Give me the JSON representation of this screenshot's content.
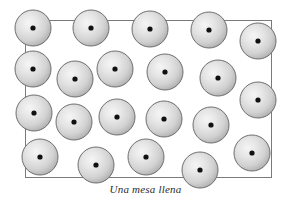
{
  "figure": {
    "caption": "Una mesa llena",
    "width": 291,
    "height": 201,
    "background_color": "#ffffff"
  },
  "table_rect": {
    "name": "table-outline",
    "x": 25,
    "y": 20,
    "width": 247,
    "height": 158,
    "stroke_color": "#7a7a7a",
    "stroke_width": 1,
    "fill_color": "none"
  },
  "sphere_style": {
    "radius": 18,
    "fill_light": "#f2f2f2",
    "fill_mid": "#d9d9d9",
    "fill_dark": "#a8a8a8",
    "stroke_color": "#6f6f6f",
    "stroke_width": 1,
    "center_dot_radius": 2.6,
    "center_dot_color": "#111111",
    "highlight_offset_x": "38%",
    "highlight_offset_y": "36%"
  },
  "spheres": [
    {
      "id": "sphere-1",
      "row": 1,
      "cx": 33,
      "cy": 28
    },
    {
      "id": "sphere-2",
      "row": 1,
      "cx": 91,
      "cy": 28
    },
    {
      "id": "sphere-3",
      "row": 1,
      "cx": 150,
      "cy": 29
    },
    {
      "id": "sphere-4",
      "row": 1,
      "cx": 209,
      "cy": 30
    },
    {
      "id": "sphere-5",
      "row": 1,
      "cx": 258,
      "cy": 41
    },
    {
      "id": "sphere-6",
      "row": 2,
      "cx": 33,
      "cy": 69
    },
    {
      "id": "sphere-7",
      "row": 2,
      "cx": 75,
      "cy": 79
    },
    {
      "id": "sphere-8",
      "row": 2,
      "cx": 115,
      "cy": 69
    },
    {
      "id": "sphere-9",
      "row": 2,
      "cx": 165,
      "cy": 72
    },
    {
      "id": "sphere-10",
      "row": 2,
      "cx": 218,
      "cy": 78
    },
    {
      "id": "sphere-11",
      "row": 3,
      "cx": 258,
      "cy": 100
    },
    {
      "id": "sphere-12",
      "row": 3,
      "cx": 34,
      "cy": 113
    },
    {
      "id": "sphere-13",
      "row": 3,
      "cx": 74,
      "cy": 122
    },
    {
      "id": "sphere-14",
      "row": 3,
      "cx": 117,
      "cy": 117
    },
    {
      "id": "sphere-15",
      "row": 3,
      "cx": 164,
      "cy": 119
    },
    {
      "id": "sphere-16",
      "row": 3,
      "cx": 211,
      "cy": 125
    },
    {
      "id": "sphere-17",
      "row": 4,
      "cx": 40,
      "cy": 157
    },
    {
      "id": "sphere-18",
      "row": 4,
      "cx": 96,
      "cy": 165
    },
    {
      "id": "sphere-19",
      "row": 4,
      "cx": 146,
      "cy": 157
    },
    {
      "id": "sphere-20",
      "row": 4,
      "cx": 200,
      "cy": 170
    },
    {
      "id": "sphere-21",
      "row": 4,
      "cx": 252,
      "cy": 153
    }
  ],
  "chart_data": {
    "type": "scatter",
    "title": "Una mesa llena",
    "subtitle": "",
    "xlabel": "",
    "ylabel": "",
    "xlim": [
      0,
      291
    ],
    "ylim": [
      0,
      201
    ],
    "grid": false,
    "legend": null,
    "annotations": [
      "Una mesa llena"
    ],
    "marker_count": 21,
    "marker_radius": 18,
    "x": [
      33,
      91,
      150,
      209,
      258,
      33,
      75,
      115,
      165,
      218,
      258,
      34,
      74,
      117,
      164,
      211,
      40,
      96,
      146,
      200,
      252
    ],
    "y": [
      28,
      28,
      29,
      30,
      41,
      69,
      79,
      69,
      72,
      78,
      100,
      113,
      122,
      117,
      119,
      125,
      157,
      165,
      157,
      170,
      153
    ]
  }
}
